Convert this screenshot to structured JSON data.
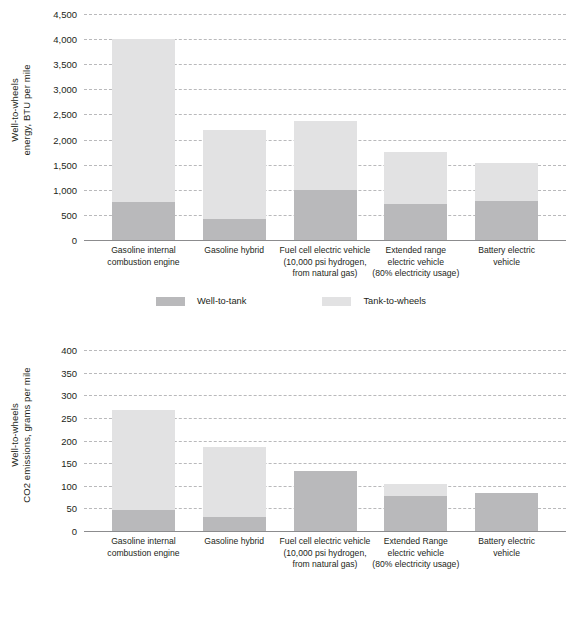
{
  "chart_data": [
    {
      "id": "energy",
      "type": "bar",
      "stacked": true,
      "title": "",
      "xlabel": "",
      "ylabel": "Well-to-wheels\nenergy, BTU per mile",
      "ylim": [
        0,
        4500
      ],
      "ytick_step": 500,
      "ytick_labels": [
        "0",
        "500",
        "1,000",
        "1,500",
        "2,000",
        "2,500",
        "3,000",
        "3,500",
        "4,000",
        "4,500"
      ],
      "ytick_values": [
        0,
        500,
        1000,
        1500,
        2000,
        2500,
        3000,
        3500,
        4000,
        4500
      ],
      "grid": true,
      "legend_position": "bottom",
      "categories": [
        "Gasoline internal\ncombustion engine",
        "Gasoline hybrid",
        "Fuel cell electric vehicle\n(10,000 psi hydrogen,\nfrom natural gas)",
        "Extended range\nelectric vehicle\n(80% electricity usage)",
        "Battery electric\nvehicle"
      ],
      "series": [
        {
          "name": "Well-to-tank",
          "color": "#b9b9bb",
          "values": [
            750,
            420,
            1000,
            720,
            780
          ]
        },
        {
          "name": "Tank-to-wheels",
          "color": "#e2e2e3",
          "values": [
            3250,
            1780,
            1370,
            1040,
            760
          ]
        }
      ],
      "totals": [
        4000,
        2200,
        2370,
        1760,
        1540
      ]
    },
    {
      "id": "emissions",
      "type": "bar",
      "stacked": true,
      "title": "",
      "xlabel": "",
      "ylabel": "Well-to-wheels\nCO2 emissions, grams per mile",
      "ylim": [
        0,
        400
      ],
      "ytick_step": 50,
      "ytick_labels": [
        "0",
        "50",
        "100",
        "150",
        "200",
        "250",
        "300",
        "350",
        "400"
      ],
      "ytick_values": [
        0,
        50,
        100,
        150,
        200,
        250,
        300,
        350,
        400
      ],
      "grid": true,
      "legend_position": "bottom",
      "categories": [
        "Gasoline internal\ncombustion engine",
        "Gasoline hybrid",
        "Fuel cell electric vehicle\n(10,000 psi hydrogen,\nfrom natural gas)",
        "Extended Range\nelectric vehicle\n(80% electricity usage)",
        "Battery electric\nvehicle"
      ],
      "series": [
        {
          "name": "Well-to-tank",
          "color": "#b9b9bb",
          "values": [
            47,
            32,
            133,
            77,
            85
          ]
        },
        {
          "name": "Tank-to-wheels",
          "color": "#e2e2e3",
          "values": [
            221,
            153,
            0,
            26,
            0
          ]
        }
      ],
      "totals": [
        268,
        185,
        133,
        103,
        85
      ]
    }
  ],
  "legend": {
    "well_to_tank": "Well-to-tank",
    "tank_to_wheels": "Tank-to-wheels"
  }
}
